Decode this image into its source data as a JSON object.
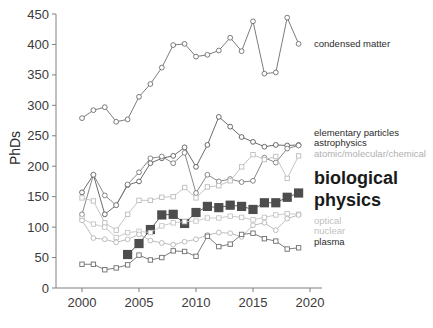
{
  "chart_data": {
    "type": "line",
    "title": "",
    "xlabel": "",
    "ylabel": "PhDs",
    "xlim": [
      1999,
      2020.5
    ],
    "ylim": [
      0,
      450
    ],
    "xticks": [
      2000,
      2005,
      2010,
      2015,
      2020
    ],
    "yticks": [
      0,
      50,
      100,
      150,
      200,
      250,
      300,
      350,
      400,
      450
    ],
    "grid": false,
    "legend_position": "right-inline",
    "x": [
      2000,
      2001,
      2002,
      2003,
      2004,
      2005,
      2006,
      2007,
      2008,
      2009,
      2010,
      2011,
      2012,
      2013,
      2014,
      2015,
      2016,
      2017,
      2018,
      2019
    ],
    "series": [
      {
        "name": "condensed matter",
        "color": "#6d6d6d",
        "marker": "circle",
        "values": [
          279,
          292,
          297,
          273,
          277,
          314,
          335,
          362,
          399,
          401,
          380,
          383,
          390,
          411,
          389,
          438,
          352,
          354,
          444,
          401
        ]
      },
      {
        "name": "elementary particles",
        "color": "#5a5a5a",
        "marker": "circle",
        "values": [
          157,
          186,
          121,
          136,
          169,
          175,
          205,
          213,
          217,
          231,
          199,
          235,
          281,
          265,
          248,
          240,
          232,
          235,
          234,
          235
        ]
      },
      {
        "name": "astrophysics",
        "color": "#7a7a7a",
        "marker": "circle",
        "values": [
          121,
          186,
          152,
          136,
          170,
          190,
          213,
          216,
          205,
          222,
          156,
          186,
          175,
          179,
          174,
          176,
          214,
          206,
          229,
          234
        ]
      },
      {
        "name": "atomic/molecular/chemical",
        "color": "#bdbdbd",
        "marker": "square",
        "values": [
          148,
          143,
          107,
          95,
          121,
          144,
          144,
          149,
          150,
          165,
          148,
          166,
          168,
          176,
          199,
          219,
          211,
          216,
          180,
          217
        ]
      },
      {
        "name": "biological physics",
        "color": "#4d4d4d",
        "marker": "filled-square",
        "values": [
          null,
          null,
          null,
          null,
          55,
          73,
          96,
          120,
          121,
          106,
          124,
          134,
          132,
          136,
          134,
          129,
          140,
          140,
          149,
          156
        ]
      },
      {
        "name": "optical",
        "color": "#c4c4c4",
        "marker": "square",
        "values": [
          114,
          105,
          100,
          83,
          91,
          93,
          91,
          102,
          107,
          109,
          110,
          115,
          115,
          118,
          116,
          112,
          116,
          120,
          122,
          121
        ]
      },
      {
        "name": "nuclear",
        "color": "#b5b5b5",
        "marker": "circle",
        "values": [
          111,
          82,
          80,
          75,
          80,
          88,
          78,
          74,
          71,
          76,
          80,
          87,
          91,
          90,
          84,
          103,
          107,
          95,
          114,
          120
        ]
      },
      {
        "name": "plasma",
        "color": "#6d6d6d",
        "marker": "square",
        "values": [
          39,
          39,
          30,
          33,
          38,
          54,
          46,
          50,
          61,
          60,
          52,
          85,
          68,
          72,
          88,
          90,
          81,
          77,
          64,
          66
        ]
      }
    ]
  },
  "legend": {
    "entries": [
      {
        "label": "condensed matter",
        "color": "#2b2b2b",
        "size": "small"
      },
      {
        "label": "elementary particles",
        "color": "#2b2b2b",
        "size": "small"
      },
      {
        "label": "astrophysics",
        "color": "#2b2b2b",
        "size": "small"
      },
      {
        "label": "atomic/molecular/chemical",
        "color": "#b0b0b0",
        "size": "small"
      },
      {
        "label": "biological",
        "color": "#1a1a1a",
        "size": "big"
      },
      {
        "label": "physics",
        "color": "#1a1a1a",
        "size": "big"
      },
      {
        "label": "optical",
        "color": "#bfbfbf",
        "size": "small"
      },
      {
        "label": "nuclear",
        "color": "#bfbfbf",
        "size": "small"
      },
      {
        "label": "plasma",
        "color": "#2b2b2b",
        "size": "small"
      }
    ]
  },
  "axes": {
    "y_title": "PhDs",
    "y_tick_labels": [
      "0",
      "50",
      "100",
      "150",
      "200",
      "250",
      "300",
      "350",
      "400",
      "450"
    ],
    "x_tick_labels": [
      "2000",
      "2005",
      "2010",
      "2015",
      "2020"
    ]
  }
}
